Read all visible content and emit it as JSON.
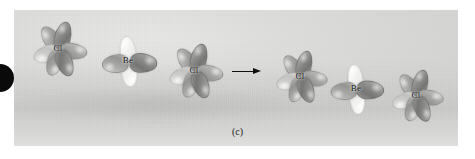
{
  "figure": {
    "caption": "(c)",
    "arrow_icon": "rightwards-arrow-icon",
    "edge_marker_icon": "black-half-disc-icon",
    "background_color": "#dededc",
    "panel_color": "#e4e4e2"
  },
  "reactants": {
    "atoms": [
      {
        "id": "cl-left",
        "label": "Cl",
        "element": "Cl",
        "orbital": "p-orbital-set",
        "x": 58,
        "y": 48
      },
      {
        "id": "be-center",
        "label": "Be",
        "element": "Be",
        "orbital": "sp-hybrid-orbital-set",
        "x": 128,
        "y": 60
      },
      {
        "id": "cl-right",
        "label": "Cl",
        "element": "Cl",
        "orbital": "p-orbital-set",
        "x": 194,
        "y": 70
      }
    ]
  },
  "product": {
    "atoms": [
      {
        "id": "cl-product-left",
        "label": "Cl",
        "element": "Cl",
        "orbital": "p-orbital-set",
        "x": 300,
        "y": 76
      },
      {
        "id": "be-product-center",
        "label": "Be",
        "element": "Be",
        "orbital": "sp-hybrid-orbital-set",
        "x": 356,
        "y": 88
      },
      {
        "id": "cl-product-right",
        "label": "Cl",
        "element": "Cl",
        "orbital": "p-orbital-set",
        "x": 416,
        "y": 95
      }
    ]
  }
}
